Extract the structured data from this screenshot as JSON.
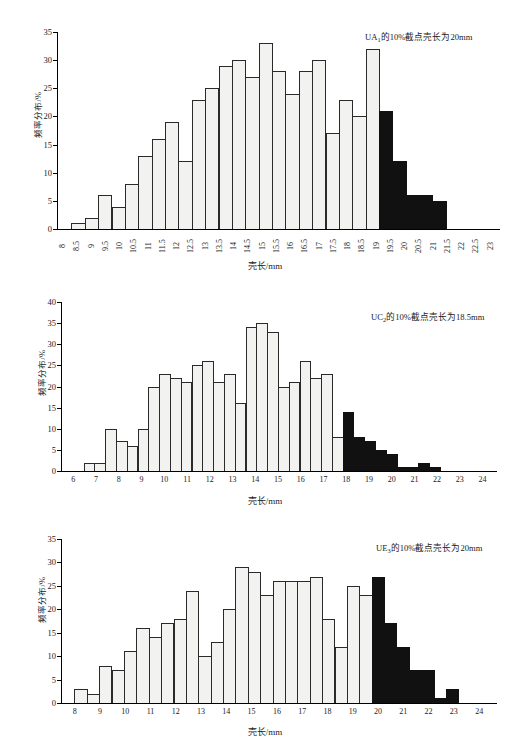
{
  "figure": {
    "axis_title_x": "壳长/mm",
    "axis_title_y": "频率分布/%"
  },
  "chart_data": [
    {
      "type": "bar",
      "id": "panel-ua1",
      "title": "",
      "annotation": "UA₁的10%截点壳长为20mm",
      "annotation_prefix": "UA",
      "annotation_sub": "1",
      "annotation_suffix": "的10%截点壳长为20mm",
      "xlabel": "壳长/mm",
      "ylabel": "频率分布/%",
      "ylim": [
        0,
        35
      ],
      "yticks": [
        0,
        5,
        10,
        15,
        20,
        25,
        30,
        35
      ],
      "xticks": [
        "8",
        "8.5",
        "9",
        "9.5",
        "10",
        "10.5",
        "11",
        "11.5",
        "12",
        "12.5",
        "13",
        "13.5",
        "14",
        "14.5",
        "15",
        "15.5",
        "16",
        "16.5",
        "17",
        "17.5",
        "18",
        "18.5",
        "19",
        "19.5",
        "20",
        "20.5",
        "21",
        "21.5",
        "22",
        "22.5",
        "23"
      ],
      "xlabel_orientation": "vertical",
      "grid": false,
      "bin_start": "8",
      "bin_width": 0.5,
      "values": [
        0,
        1,
        2,
        6,
        4,
        8,
        13,
        16,
        19,
        12,
        23,
        25,
        29,
        30,
        27,
        33,
        28,
        24,
        28,
        30,
        17,
        23,
        20,
        32,
        21,
        12,
        6,
        6,
        5,
        0
      ],
      "dark_from_index": 24,
      "cutoff_label": "20mm"
    },
    {
      "type": "bar",
      "id": "panel-uc2",
      "title": "",
      "annotation": "UC₂的10%截点壳长为18.5mm",
      "annotation_prefix": "UC",
      "annotation_sub": "2",
      "annotation_suffix": "的10%截点壳长为18.5mm",
      "xlabel": "壳长/mm",
      "ylabel": "频率分布/%",
      "ylim": [
        0,
        40
      ],
      "yticks": [
        0,
        5,
        10,
        15,
        20,
        25,
        30,
        35,
        40
      ],
      "xticks": [
        "6",
        "7",
        "8",
        "9",
        "10",
        "11",
        "12",
        "13",
        "14",
        "15",
        "16",
        "17",
        "18",
        "19",
        "20",
        "21",
        "22",
        "23",
        "24"
      ],
      "xlabel_orientation": "horizontal",
      "grid": false,
      "bin_start": "6",
      "bin_width": 0.5,
      "values": [
        0,
        0,
        2,
        2,
        10,
        7,
        6,
        10,
        20,
        23,
        22,
        21,
        25,
        26,
        21,
        23,
        16,
        34,
        35,
        33,
        20,
        21,
        26,
        22,
        23,
        8,
        14,
        8,
        7,
        5,
        4,
        1,
        1,
        2,
        1,
        0
      ],
      "dark_from_index": 26,
      "cutoff_label": "18.5mm"
    },
    {
      "type": "bar",
      "id": "panel-ue3",
      "title": "",
      "annotation": "UE₃的10%截点壳长为20mm",
      "annotation_prefix": "UE",
      "annotation_sub": "3",
      "annotation_suffix": "的10%截点壳长为20mm",
      "xlabel": "壳长/mm",
      "ylabel": "频率分布/%",
      "ylim": [
        0,
        35
      ],
      "yticks": [
        0,
        5,
        10,
        15,
        20,
        25,
        30,
        35
      ],
      "xticks": [
        "8",
        "9",
        "10",
        "11",
        "12",
        "13",
        "14",
        "15",
        "16",
        "17",
        "18",
        "19",
        "20",
        "21",
        "22",
        "23",
        "24"
      ],
      "xlabel_orientation": "horizontal",
      "grid": false,
      "bin_start": "8",
      "bin_width": 0.5,
      "values": [
        0,
        3,
        2,
        8,
        7,
        11,
        16,
        14,
        17,
        18,
        24,
        10,
        13,
        20,
        29,
        28,
        23,
        26,
        26,
        26,
        27,
        18,
        12,
        25,
        23,
        27,
        17,
        12,
        7,
        7,
        1,
        3
      ],
      "dark_from_index": 25,
      "cutoff_label": "20mm"
    }
  ]
}
